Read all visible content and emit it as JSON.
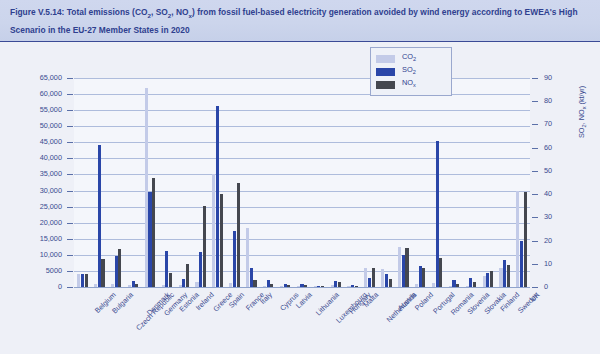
{
  "caption": {
    "prefix": "Figure V.5.14:",
    "line1": "Figure V.5.14: Total emissions (CO2, SO2, NOx) from fossil fuel-based electricity generation avoided by wind energy according to",
    "line2": "EWEA's High Scenario in the EU-27 Member States in 2020"
  },
  "legend": {
    "items": [
      {
        "label": "CO",
        "sub": "2",
        "color": "#c3cbe8",
        "name": "co2"
      },
      {
        "label": "SO",
        "sub": "2",
        "color": "#2a46a8",
        "name": "so2"
      },
      {
        "label": "NO",
        "sub": "x",
        "color": "#44474f",
        "name": "nox"
      }
    ]
  },
  "chart_data": {
    "type": "bar",
    "title": "Total emissions (CO2, SO2, NOx) from fossil fuel-based electricity generation avoided by wind energy according to EWEA's High Scenario in the EU-27 Member States in 2020",
    "xlabel": "",
    "ylabel": "CO2 (kt/yr)",
    "ylabel_right": "SO2, NOx (kt/yr)",
    "ylim": [
      0,
      65000
    ],
    "ylim_right": [
      0,
      90
    ],
    "yticks": [
      0,
      5000,
      10000,
      15000,
      20000,
      25000,
      30000,
      35000,
      40000,
      45000,
      50000,
      55000,
      60000,
      65000
    ],
    "ytick_labels": [
      "0",
      "5000",
      "10,000",
      "15,000",
      "20,000",
      "25,000",
      "30,000",
      "35,000",
      "40,000",
      "45,000",
      "50,000",
      "55,000",
      "60,000",
      "65,000"
    ],
    "yticks_right": [
      0,
      10,
      20,
      30,
      40,
      50,
      60,
      70,
      80,
      90
    ],
    "ytick_labels_right": [
      "0",
      "10",
      "20",
      "30",
      "40",
      "50",
      "60",
      "70",
      "80",
      "90"
    ],
    "grid": true,
    "legend_position": "top-right",
    "categories": [
      "Belgium",
      "Bulgaria",
      "Czech Republic",
      "Denmark",
      "Germany",
      "Estonia",
      "Ireland",
      "Greece",
      "Spain",
      "France",
      "Italy",
      "Cyprus",
      "Latvia",
      "Lithuania",
      "Luxembourg",
      "Hungary",
      "Malta",
      "Netherlands",
      "Austria",
      "Poland",
      "Portugal",
      "Romania",
      "Slovenia",
      "Slovakia",
      "Finland",
      "Sweden",
      "UK"
    ],
    "series": [
      {
        "name": "CO2",
        "axis": "left",
        "unit": "kt/yr",
        "color": "#c3cbe8",
        "values": [
          4000,
          1000,
          800,
          700,
          62000,
          600,
          700,
          1500,
          35000,
          1200,
          18500,
          400,
          300,
          300,
          200,
          500,
          200,
          6000,
          5500,
          12500,
          1000,
          1100,
          300,
          300,
          3500,
          6000,
          30000
        ]
      },
      {
        "name": "SO2",
        "axis": "right",
        "unit": "kt/yr",
        "color": "#2a46a8",
        "values": [
          5.5,
          61,
          13.5,
          2.5,
          41,
          15.5,
          3.5,
          15,
          78,
          24,
          8,
          3,
          1.5,
          1.5,
          0.5,
          2.5,
          1,
          4,
          5.5,
          14,
          9,
          63,
          3,
          4,
          6,
          11.5,
          20
        ]
      },
      {
        "name": "NOx",
        "axis": "right",
        "unit": "kt/yr",
        "color": "#44474f",
        "values": [
          5.5,
          12,
          16.5,
          1.5,
          47,
          6,
          10,
          35,
          40,
          45,
          3,
          1.5,
          1,
          1,
          0.5,
          2,
          0.5,
          8,
          3.5,
          17,
          8,
          12.5,
          1.5,
          2,
          7,
          9.5,
          41
        ]
      }
    ]
  }
}
